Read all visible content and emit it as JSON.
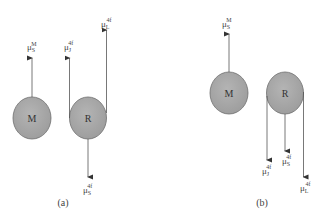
{
  "colors": {
    "circle_fill": "#a9a9a9",
    "circle_stroke": "#6e6e6e",
    "line": "#555555",
    "background": "#ffffff"
  },
  "panels": [
    {
      "caption": "(a)",
      "nodes": [
        {
          "label": "M"
        },
        {
          "label": "R"
        }
      ],
      "vectors": [
        {
          "symbol": "μ",
          "sub": "S",
          "sup": "M",
          "direction": "up",
          "from": "M"
        },
        {
          "symbol": "μ",
          "sub": "J",
          "sup": "4f",
          "direction": "up",
          "from": "R-left"
        },
        {
          "symbol": "μ",
          "sub": "L",
          "sup": "4f",
          "direction": "up",
          "from": "R-right"
        },
        {
          "symbol": "μ",
          "sub": "S",
          "sup": "4f",
          "direction": "down",
          "from": "R-bottom"
        }
      ]
    },
    {
      "caption": "(b)",
      "nodes": [
        {
          "label": "M"
        },
        {
          "label": "R"
        }
      ],
      "vectors": [
        {
          "symbol": "μ",
          "sub": "S",
          "sup": "M",
          "direction": "up",
          "from": "M"
        },
        {
          "symbol": "μ",
          "sub": "J",
          "sup": "4f",
          "direction": "down",
          "from": "R-left"
        },
        {
          "symbol": "μ",
          "sub": "S",
          "sup": "4f",
          "direction": "down",
          "from": "R-bottom"
        },
        {
          "symbol": "μ",
          "sub": "L",
          "sup": "4f",
          "direction": "down",
          "from": "R-right"
        }
      ]
    }
  ]
}
